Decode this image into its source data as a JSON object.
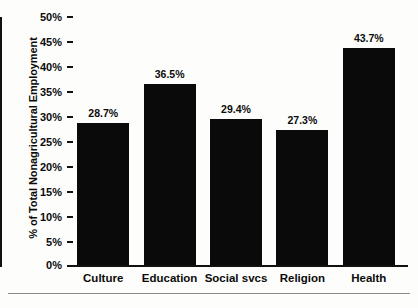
{
  "chart_data": {
    "type": "bar",
    "title": "",
    "xlabel": "",
    "ylabel": "% of Total Nonagricultural Employment",
    "categories": [
      "Culture",
      "Education",
      "Social svcs",
      "Religion",
      "Health"
    ],
    "values": [
      28.7,
      36.5,
      29.4,
      27.3,
      43.7
    ],
    "value_labels": [
      "28.7%",
      "36.5%",
      "29.4%",
      "27.3%",
      "43.7%"
    ],
    "ylim": [
      0,
      50
    ],
    "ytick_values": [
      50,
      45,
      40,
      35,
      30,
      25,
      20,
      15,
      10,
      5,
      0
    ],
    "ytick_labels": [
      "50%",
      "45%",
      "40%",
      "35%",
      "30%",
      "25%",
      "20%",
      "15%",
      "10%",
      "5%",
      "0%"
    ],
    "grid": false,
    "legend": false,
    "bar_color": "#0a0a0a",
    "axis_color": "#111111",
    "background": "#fdfdfb"
  }
}
